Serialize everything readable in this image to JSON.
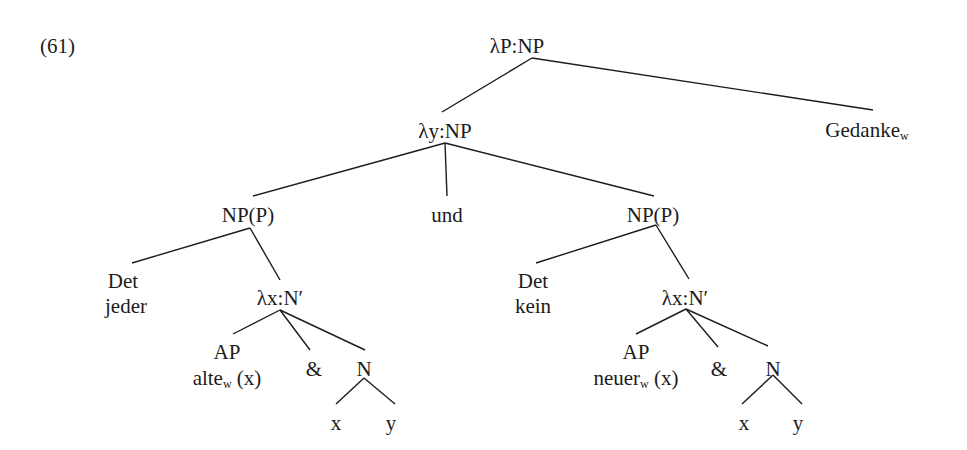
{
  "example_number": "(61)",
  "tree": {
    "root": "λP:NP",
    "nodes": [
      {
        "id": "root",
        "text": "λP:NP",
        "sub": "",
        "x": 517,
        "y": 34
      },
      {
        "id": "gedanke",
        "text": "Gedanke",
        "sub": "w",
        "x": 867,
        "y": 118
      },
      {
        "id": "ynp",
        "text": "λy:NP",
        "sub": "",
        "x": 445,
        "y": 119
      },
      {
        "id": "np1",
        "text": "NP(P)",
        "sub": "",
        "x": 248,
        "y": 203
      },
      {
        "id": "und",
        "text": "und",
        "sub": "",
        "x": 447,
        "y": 203
      },
      {
        "id": "np2",
        "text": "NP(P)",
        "sub": "",
        "x": 653,
        "y": 203
      },
      {
        "id": "det1",
        "text": "Det",
        "sub": "",
        "x": 123,
        "y": 269
      },
      {
        "id": "jeder",
        "text": "jeder",
        "sub": "",
        "x": 126,
        "y": 294
      },
      {
        "id": "lx1",
        "text": "λx:N′",
        "sub": "",
        "x": 280,
        "y": 286
      },
      {
        "id": "ap1",
        "text": "AP",
        "sub": "",
        "x": 227,
        "y": 340
      },
      {
        "id": "alte",
        "text": "alte",
        "sub": "w",
        "x": 227,
        "y": 366,
        "suffix": " (x)"
      },
      {
        "id": "amp1",
        "text": "&",
        "sub": "",
        "x": 314,
        "y": 357
      },
      {
        "id": "n1",
        "text": "N",
        "sub": "",
        "x": 364,
        "y": 357
      },
      {
        "id": "x1",
        "text": "x",
        "sub": "",
        "x": 336,
        "y": 411
      },
      {
        "id": "y1",
        "text": "y",
        "sub": "",
        "x": 391,
        "y": 411
      },
      {
        "id": "det2",
        "text": "Det",
        "sub": "",
        "x": 533,
        "y": 269
      },
      {
        "id": "kein",
        "text": "kein",
        "sub": "",
        "x": 533,
        "y": 294
      },
      {
        "id": "lx2",
        "text": "λx:N′",
        "sub": "",
        "x": 685,
        "y": 286
      },
      {
        "id": "ap2",
        "text": "AP",
        "sub": "",
        "x": 636,
        "y": 340
      },
      {
        "id": "neuer",
        "text": "neuer",
        "sub": "w",
        "x": 636,
        "y": 366,
        "suffix": " (x)"
      },
      {
        "id": "amp2",
        "text": "&",
        "sub": "",
        "x": 719,
        "y": 357
      },
      {
        "id": "n2",
        "text": "N",
        "sub": "",
        "x": 773,
        "y": 357
      },
      {
        "id": "x2",
        "text": "x",
        "sub": "",
        "x": 744,
        "y": 411
      },
      {
        "id": "y2",
        "text": "y",
        "sub": "",
        "x": 798,
        "y": 411
      }
    ],
    "edges": [
      [
        532,
        58,
        442,
        112
      ],
      [
        532,
        58,
        873,
        110
      ],
      [
        445,
        143,
        253,
        196
      ],
      [
        445,
        143,
        447,
        196
      ],
      [
        445,
        143,
        654,
        196
      ],
      [
        250,
        228,
        132,
        263
      ],
      [
        250,
        228,
        280,
        280
      ],
      [
        280,
        310,
        233,
        334
      ],
      [
        280,
        310,
        310,
        350
      ],
      [
        280,
        310,
        365,
        350
      ],
      [
        364,
        378,
        336,
        404
      ],
      [
        364,
        378,
        395,
        404
      ],
      [
        656,
        225,
        536,
        263
      ],
      [
        656,
        225,
        689,
        279
      ],
      [
        686,
        309,
        636,
        334
      ],
      [
        686,
        309,
        718,
        347
      ],
      [
        686,
        309,
        768,
        346
      ],
      [
        773,
        375,
        742,
        404
      ],
      [
        773,
        375,
        802,
        404
      ]
    ]
  }
}
